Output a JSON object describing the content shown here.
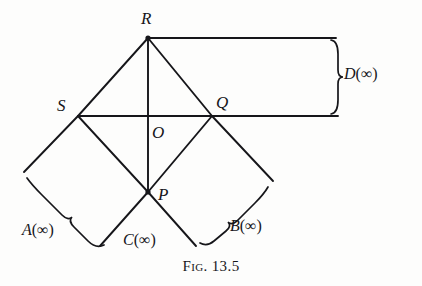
{
  "figure": {
    "caption_prefix": "Fig.",
    "caption_number": "13.5",
    "ink_color": "#16161a",
    "background_color": "#fdfdfc"
  },
  "vertices": [
    {
      "id": "R",
      "label": "R",
      "x": 148,
      "y": 38,
      "label_x": 141,
      "label_y": 10
    },
    {
      "id": "S",
      "label": "S",
      "x": 78,
      "y": 116,
      "label_x": 57,
      "label_y": 97
    },
    {
      "id": "Q",
      "label": "Q",
      "x": 212,
      "y": 116,
      "label_x": 216,
      "label_y": 94
    },
    {
      "id": "O",
      "label": "O",
      "x": 148,
      "y": 116,
      "label_x": 152,
      "label_y": 124
    },
    {
      "id": "P",
      "label": "P",
      "x": 148,
      "y": 192,
      "label_x": 158,
      "label_y": 186
    }
  ],
  "regions": [
    {
      "id": "A",
      "symbol": "A",
      "open": "(",
      "infinity": "∞",
      "close": ")",
      "text": "A(∞)",
      "label_x": 22,
      "label_y": 222
    },
    {
      "id": "B",
      "symbol": "B",
      "open": "(",
      "infinity": "∞",
      "close": ")",
      "text": "B(∞)",
      "label_x": 230,
      "label_y": 218
    },
    {
      "id": "C",
      "symbol": "C",
      "open": "(",
      "infinity": "∞",
      "close": ")",
      "text": "C(∞)",
      "label_x": 123,
      "label_y": 232
    },
    {
      "id": "D",
      "symbol": "D",
      "open": "(",
      "infinity": "∞",
      "close": ")",
      "text": "D(∞)",
      "label_x": 344,
      "label_y": 66
    }
  ],
  "segments": [
    {
      "name": "edge-R-S",
      "x1": 148,
      "y1": 38,
      "x2": 78,
      "y2": 116
    },
    {
      "name": "edge-R-Q",
      "x1": 148,
      "y1": 38,
      "x2": 212,
      "y2": 116
    },
    {
      "name": "edge-S-P",
      "x1": 78,
      "y1": 116,
      "x2": 148,
      "y2": 192
    },
    {
      "name": "edge-P-Q",
      "x1": 148,
      "y1": 192,
      "x2": 212,
      "y2": 116
    },
    {
      "name": "diagonal-R-P",
      "x1": 148,
      "y1": 38,
      "x2": 148,
      "y2": 192
    },
    {
      "name": "diagonal-S-Q",
      "x1": 78,
      "y1": 116,
      "x2": 212,
      "y2": 116
    },
    {
      "name": "ray-S-down-left",
      "x1": 78,
      "y1": 116,
      "x2": 24,
      "y2": 172
    },
    {
      "name": "ray-Q-down-right",
      "x1": 212,
      "y1": 116,
      "x2": 273,
      "y2": 181
    },
    {
      "name": "ray-P-down-left",
      "x1": 148,
      "y1": 192,
      "x2": 100,
      "y2": 246
    },
    {
      "name": "ray-P-down-right",
      "x1": 148,
      "y1": 192,
      "x2": 196,
      "y2": 246
    },
    {
      "name": "ray-R-right",
      "x1": 148,
      "y1": 38,
      "x2": 336,
      "y2": 38
    },
    {
      "name": "ray-Q-right",
      "x1": 212,
      "y1": 116,
      "x2": 338,
      "y2": 116
    }
  ],
  "braces": [
    {
      "name": "brace-D",
      "orientation": "vertical",
      "path": "M 331 40 Q 338 41 338 54 L 338 70 Q 338 77 343 77 Q 338 77 338 84 L 338 100 Q 338 113 331 114"
    },
    {
      "name": "brace-A",
      "orientation": "diagonal-sw",
      "path": "M 27 178 Q 32 185 42 195 L 62 215 Q 68 221 72 217 Q 68 221 74 227 L 88 241 Q 96 249 104 245"
    },
    {
      "name": "brace-B",
      "orientation": "diagonal-se",
      "path": "M 268 187 Q 264 194 255 203 L 238 220 Q 232 226 228 222 Q 232 226 226 231 L 214 241 Q 207 247 200 243"
    }
  ]
}
